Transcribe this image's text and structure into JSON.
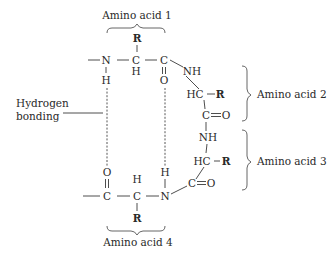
{
  "diagram": {
    "labels": {
      "amino_acid_1": "Amino acid 1",
      "amino_acid_2": "Amino acid 2",
      "amino_acid_3": "Amino acid 3",
      "amino_acid_4": "Amino acid 4",
      "hydrogen_bonding_line1": "Hydrogen",
      "hydrogen_bonding_line2": "bonding"
    },
    "atoms": {
      "aa1_R": "R",
      "aa1_N": "N",
      "aa1_CA": "C",
      "aa1_HA": "H",
      "aa1_C": "C",
      "aa1_O": "O",
      "aa1_NH_H": "H",
      "aa2_NH": "NH",
      "aa2_HC": "HC",
      "aa2_R": "R",
      "aa2_C": "C",
      "aa2_O": "O",
      "aa3_NH": "NH",
      "aa3_HC": "HC",
      "aa3_R": "R",
      "aa3_C": "C",
      "aa3_O": "O",
      "aa4_O": "O",
      "aa4_C": "C",
      "aa4_HA": "H",
      "aa4_CA": "C",
      "aa4_R": "R",
      "aa4_N": "N",
      "aa4_NH_H": "H"
    },
    "colors": {
      "background": "#ffffff",
      "ink": "#2a2a2a"
    }
  }
}
